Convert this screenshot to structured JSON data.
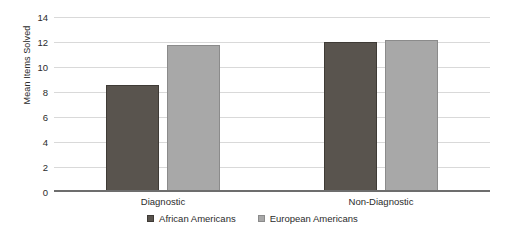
{
  "chart_data": {
    "type": "bar",
    "title": "",
    "xlabel": "",
    "ylabel": "Mean Items Solved",
    "ylim": [
      0,
      14
    ],
    "ytick_step": 2,
    "yticks": [
      "14",
      "12",
      "10",
      "8",
      "6",
      "4",
      "2",
      "0"
    ],
    "categories": [
      "Diagnostic",
      "Non-Diagnostic"
    ],
    "grid": true,
    "legend_position": "bottom-center",
    "series": [
      {
        "name": "African Americans",
        "color": "#59544e",
        "values": [
          8.6,
          12.0
        ]
      },
      {
        "name": "European Americans",
        "color": "#a8a8a8",
        "values": [
          11.75,
          12.2
        ]
      }
    ]
  },
  "colors": {
    "series_dark": "#59544e",
    "series_light": "#a8a8a8",
    "gridline": "#d9d9d9",
    "axis": "#6d6d6d",
    "background": "#ffffff",
    "text": "#2b2b2b"
  }
}
